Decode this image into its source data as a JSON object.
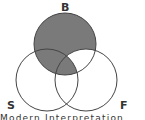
{
  "diagram": {
    "type": "venn",
    "sets": [
      {
        "id": "B",
        "label": "B",
        "cx": 65,
        "cy": 44,
        "r": 31
      },
      {
        "id": "S",
        "label": "S",
        "cx": 47,
        "cy": 80,
        "r": 31
      },
      {
        "id": "F",
        "label": "F",
        "cx": 86,
        "cy": 80,
        "r": 31
      }
    ],
    "shaded_region": "B minus (F minus S)",
    "shade_color": "#7a7a7a",
    "stroke_color": "#444444"
  },
  "labels": {
    "top": "B",
    "left": "S",
    "right": "F"
  },
  "caption": "Modern Interpretation"
}
